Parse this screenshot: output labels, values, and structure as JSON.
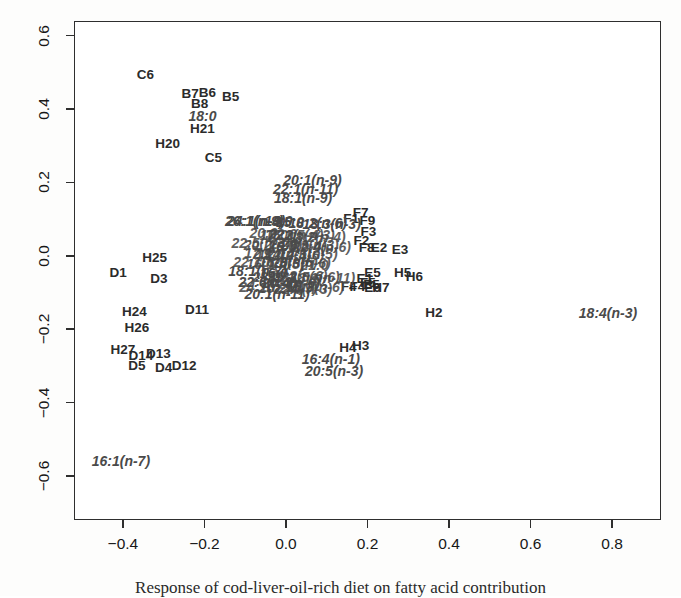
{
  "figure": {
    "width": 681,
    "height": 596,
    "background": "#ffffff",
    "foreground": "#2e2e2e"
  },
  "caption": {
    "text": "Response of cod-liver-oil-rich diet on fatty acid contribution"
  },
  "chart_data": {
    "type": "scatter",
    "title": "",
    "subtitle": "",
    "xlabel": "",
    "ylabel": "",
    "xlim": [
      -0.52,
      0.92
    ],
    "ylim": [
      -0.72,
      0.64
    ],
    "grid": false,
    "legend": "none",
    "xticks": [
      -0.4,
      -0.2,
      0.0,
      0.2,
      0.4,
      0.6,
      0.8
    ],
    "xticklabels": [
      "-0.4",
      "-0.2",
      "0.0",
      "0.2",
      "0.4",
      "0.6",
      "0.8"
    ],
    "yticks": [
      -0.6,
      -0.4,
      -0.2,
      0.0,
      0.2,
      0.4,
      0.6
    ],
    "yticklabels": [
      "-0.6",
      "-0.4",
      "-0.2",
      "0.0",
      "0.2",
      "0.4",
      "0.6"
    ],
    "marker_style": "text-label",
    "series": [
      {
        "name": "samples",
        "style": "upright-bold",
        "points": [
          {
            "label": "C6",
            "x": -0.345,
            "y": 0.494
          },
          {
            "label": "B7",
            "x": -0.235,
            "y": 0.441
          },
          {
            "label": "B6",
            "x": -0.193,
            "y": 0.444
          },
          {
            "label": "B5",
            "x": -0.136,
            "y": 0.432
          },
          {
            "label": "B8",
            "x": -0.212,
            "y": 0.414
          },
          {
            "label": "H21",
            "x": -0.205,
            "y": 0.347
          },
          {
            "label": "H20",
            "x": -0.29,
            "y": 0.305
          },
          {
            "label": "C5",
            "x": -0.178,
            "y": 0.267
          },
          {
            "label": "H25",
            "x": -0.322,
            "y": -0.005
          },
          {
            "label": "D1",
            "x": -0.412,
            "y": -0.048
          },
          {
            "label": "D3",
            "x": -0.312,
            "y": -0.062
          },
          {
            "label": "D11",
            "x": -0.218,
            "y": -0.148
          },
          {
            "label": "H24",
            "x": -0.372,
            "y": -0.152
          },
          {
            "label": "H26",
            "x": -0.366,
            "y": -0.196
          },
          {
            "label": "H27",
            "x": -0.4,
            "y": -0.256
          },
          {
            "label": "D14",
            "x": -0.356,
            "y": -0.272
          },
          {
            "label": "D13",
            "x": -0.313,
            "y": -0.268
          },
          {
            "label": "D5",
            "x": -0.366,
            "y": -0.3
          },
          {
            "label": "D4",
            "x": -0.3,
            "y": -0.305
          },
          {
            "label": "D12",
            "x": -0.25,
            "y": -0.3
          },
          {
            "label": "F1",
            "x": 0.16,
            "y": 0.1
          },
          {
            "label": "F7",
            "x": 0.183,
            "y": 0.116
          },
          {
            "label": "F9",
            "x": 0.2,
            "y": 0.096
          },
          {
            "label": "F3",
            "x": 0.202,
            "y": 0.066
          },
          {
            "label": "F2",
            "x": 0.185,
            "y": 0.04
          },
          {
            "label": "F8",
            "x": 0.198,
            "y": 0.02
          },
          {
            "label": "E2",
            "x": 0.228,
            "y": 0.02
          },
          {
            "label": "E3",
            "x": 0.28,
            "y": 0.016
          },
          {
            "label": "E5",
            "x": 0.212,
            "y": -0.046
          },
          {
            "label": "H5",
            "x": 0.286,
            "y": -0.046
          },
          {
            "label": "H6",
            "x": 0.315,
            "y": -0.058
          },
          {
            "label": "E1",
            "x": 0.193,
            "y": -0.064
          },
          {
            "label": "F5",
            "x": 0.201,
            "y": -0.074
          },
          {
            "label": "E5b",
            "x": 0.21,
            "y": -0.08
          },
          {
            "label": "F4",
            "x": 0.154,
            "y": -0.086
          },
          {
            "label": "F4b",
            "x": 0.175,
            "y": -0.086
          },
          {
            "label": "E6",
            "x": 0.212,
            "y": -0.088
          },
          {
            "label": "H7",
            "x": 0.233,
            "y": -0.088
          },
          {
            "label": "H2",
            "x": 0.363,
            "y": -0.155
          },
          {
            "label": "H4",
            "x": 0.152,
            "y": -0.252
          },
          {
            "label": "H3",
            "x": 0.183,
            "y": -0.246
          }
        ]
      },
      {
        "name": "variables",
        "style": "italic-bold",
        "points": [
          {
            "label": "18:0",
            "x": -0.205,
            "y": 0.382
          },
          {
            "label": "20:1(n-9)",
            "x": 0.065,
            "y": 0.208
          },
          {
            "label": "22:1(n-11)",
            "x": 0.048,
            "y": 0.182
          },
          {
            "label": "18:1(n-9)",
            "x": 0.042,
            "y": 0.158
          },
          {
            "label": "24:1(n-9)",
            "x": -0.073,
            "y": 0.096
          },
          {
            "label": "26:1(n-9)",
            "x": -0.078,
            "y": 0.094
          },
          {
            "label": "14:0",
            "x": -0.018,
            "y": 0.096
          },
          {
            "label": "15:0",
            "x": 0.01,
            "y": 0.092
          },
          {
            "label": "18:2(n-6)",
            "x": 0.078,
            "y": 0.09
          },
          {
            "label": "18:3(n-3)",
            "x": 0.112,
            "y": 0.088
          },
          {
            "label": "18:1(n-7)",
            "x": -0.07,
            "y": -0.042
          },
          {
            "label": "16:0",
            "x": -0.03,
            "y": -0.046
          },
          {
            "label": "22:6(n-3)",
            "x": -0.045,
            "y": -0.072
          },
          {
            "label": "20:4(n-6)",
            "x": 0.012,
            "y": -0.074
          },
          {
            "label": "20:1(n-11)",
            "x": -0.022,
            "y": -0.104
          },
          {
            "label": "16:4(n-1)",
            "x": 0.11,
            "y": -0.282
          },
          {
            "label": "20:5(n-3)",
            "x": 0.118,
            "y": -0.314
          },
          {
            "label": "18:4(n-3)",
            "x": 0.79,
            "y": -0.156
          },
          {
            "label": "16:1(n-7)",
            "x": -0.405,
            "y": -0.56
          }
        ]
      },
      {
        "name": "dense-core-overplot",
        "style": "italic-bold-overlapped",
        "note": "unreadable overplotted variable labels at the cluster centre",
        "points": [
          {
            "label": "20:0",
            "x": -0.055,
            "y": 0.062
          },
          {
            "label": "17:0",
            "x": -0.03,
            "y": 0.058
          },
          {
            "label": "22:0",
            "x": -0.008,
            "y": 0.06
          },
          {
            "label": "16:2(n-4)",
            "x": 0.02,
            "y": 0.056
          },
          {
            "label": "21:5(n-3)",
            "x": 0.048,
            "y": 0.058
          },
          {
            "label": "18:2(n-4)",
            "x": 0.075,
            "y": 0.05
          },
          {
            "label": "22:5(n-3)",
            "x": -0.062,
            "y": 0.034
          },
          {
            "label": "20:2(n-6)",
            "x": -0.032,
            "y": 0.03
          },
          {
            "label": "24:0",
            "x": -0.005,
            "y": 0.032
          },
          {
            "label": "16:3(n-4)",
            "x": 0.028,
            "y": 0.028
          },
          {
            "label": "20:3(n-3)",
            "x": 0.058,
            "y": 0.03
          },
          {
            "label": "22:4(n-6)",
            "x": 0.088,
            "y": 0.024
          },
          {
            "label": "17:1",
            "x": -0.068,
            "y": 0.008
          },
          {
            "label": "19:0",
            "x": -0.04,
            "y": 0.004
          },
          {
            "label": "20:4(n-3)",
            "x": -0.01,
            "y": 0.006
          },
          {
            "label": "22:2(n-6)",
            "x": 0.022,
            "y": 0.002
          },
          {
            "label": "14:1(n-5)",
            "x": 0.055,
            "y": 0.004
          },
          {
            "label": "22:1(n-9)",
            "x": -0.058,
            "y": -0.018
          },
          {
            "label": "16:1(n-5)",
            "x": -0.026,
            "y": -0.022
          },
          {
            "label": "18:3(n-6)",
            "x": 0.006,
            "y": -0.018
          },
          {
            "label": "20:3(n-6)",
            "x": 0.038,
            "y": -0.02
          },
          {
            "label": "21:0",
            "x": 0.07,
            "y": -0.024
          },
          {
            "label": "23:0",
            "x": -0.048,
            "y": -0.058
          },
          {
            "label": "15:1",
            "x": -0.012,
            "y": -0.06
          },
          {
            "label": "16:2(n-6)",
            "x": 0.03,
            "y": -0.056
          },
          {
            "label": "22:5(n-6)",
            "x": 0.06,
            "y": -0.058
          },
          {
            "label": "18:1(n-11)",
            "x": 0.09,
            "y": -0.06
          },
          {
            "label": "24:1(n-11)",
            "x": -0.035,
            "y": -0.086
          },
          {
            "label": "20:2(n-9)",
            "x": 0.005,
            "y": -0.088
          },
          {
            "label": "22:3(n-3)",
            "x": 0.042,
            "y": -0.09
          },
          {
            "label": "16:3(n-6)",
            "x": 0.072,
            "y": -0.086
          }
        ]
      }
    ]
  }
}
